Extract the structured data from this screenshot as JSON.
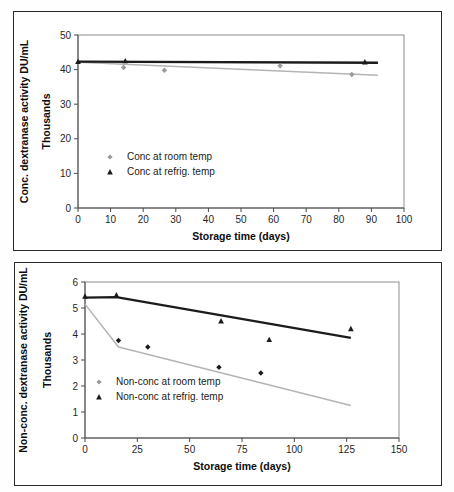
{
  "page": {
    "background": "#ffffff",
    "frame_color": "#2a2a2a"
  },
  "colors": {
    "dark_series": "#1b1b1b",
    "light_series": "#b4b4b4",
    "marker_dark": "#1b1b1b",
    "marker_light": "#9a9a9a",
    "axis": "#4a4a4a",
    "plot_frame": "#8d8d8d"
  },
  "figures": [
    {
      "id": "conc",
      "name": "concentrated-dextranase-chart",
      "ylabel_line1": "Conc. dextranase activity DU/mL",
      "ylabel_line2": "Thousands",
      "xlabel": "Storage time (days)",
      "yticks": [
        "0",
        "10",
        "20",
        "30",
        "40",
        "50"
      ],
      "xticks": [
        "0",
        "10",
        "20",
        "30",
        "40",
        "50",
        "60",
        "70",
        "80",
        "90",
        "100"
      ],
      "legend": [
        {
          "marker": "diamond",
          "label": "Conc at room temp"
        },
        {
          "marker": "triangle",
          "label": "Conc at refrig. temp"
        }
      ]
    },
    {
      "id": "nonconc",
      "name": "non-concentrated-dextranase-chart",
      "ylabel_line1": "Non-conc. dextranase activity DU/mL",
      "ylabel_line2": "Thousands",
      "xlabel": "Storage time (days)",
      "yticks": [
        "0",
        "1",
        "2",
        "3",
        "4",
        "5",
        "6"
      ],
      "xticks": [
        "0",
        "25",
        "50",
        "75",
        "100",
        "125",
        "150"
      ],
      "legend": [
        {
          "marker": "diamond",
          "label": "Non-conc at room temp"
        },
        {
          "marker": "triangle",
          "label": "Non-conc at refrig. temp"
        }
      ]
    }
  ],
  "chart_data": [
    {
      "type": "scatter",
      "id": "conc",
      "title": "",
      "xlabel": "Storage time (days)",
      "ylabel": "Conc. dextranase activity DU/mL (Thousands)",
      "xlim": [
        0,
        100
      ],
      "ylim": [
        0,
        50
      ],
      "xticks": [
        0,
        10,
        20,
        30,
        40,
        50,
        60,
        70,
        80,
        90,
        100
      ],
      "yticks": [
        0,
        10,
        20,
        30,
        40,
        50
      ],
      "grid": false,
      "legend_position": "inside-lower-left",
      "series": [
        {
          "name": "Conc at room temp",
          "marker": "diamond",
          "color": "#9a9a9a",
          "points": [
            {
              "x": 14.0,
              "y": 40.6
            },
            {
              "x": 26.5,
              "y": 39.8
            },
            {
              "x": 62.0,
              "y": 41.1
            },
            {
              "x": 84.0,
              "y": 38.6
            }
          ],
          "trendline": {
            "color": "#b4b4b4",
            "points": [
              {
                "x": 0,
                "y": 42.1
              },
              {
                "x": 92,
                "y": 38.4
              }
            ]
          }
        },
        {
          "name": "Conc at refrig. temp",
          "marker": "triangle",
          "color": "#1b1b1b",
          "points": [
            {
              "x": 0.0,
              "y": 42.3
            },
            {
              "x": 14.5,
              "y": 42.5
            },
            {
              "x": 88.0,
              "y": 42.2
            }
          ],
          "trendline": {
            "color": "#1b1b1b",
            "points": [
              {
                "x": 0,
                "y": 42.3
              },
              {
                "x": 92,
                "y": 42.0
              }
            ]
          }
        }
      ]
    },
    {
      "type": "scatter",
      "id": "nonconc",
      "title": "",
      "xlabel": "Storage time (days)",
      "ylabel": "Non-conc. dextranase activity DU/mL (Thousands)",
      "xlim": [
        0,
        150
      ],
      "ylim": [
        0,
        6
      ],
      "xticks": [
        0,
        25,
        50,
        75,
        100,
        125,
        150
      ],
      "yticks": [
        0,
        1,
        2,
        3,
        4,
        5,
        6
      ],
      "grid": false,
      "legend_position": "inside-lower-left",
      "series": [
        {
          "name": "Non-conc at room temp",
          "marker": "diamond",
          "color": "#1b1b1b",
          "points": [
            {
              "x": 16.0,
              "y": 3.75
            },
            {
              "x": 30.0,
              "y": 3.5
            },
            {
              "x": 64.0,
              "y": 2.72
            },
            {
              "x": 84.0,
              "y": 2.5
            }
          ],
          "trendline": {
            "color": "#b4b4b4",
            "points": [
              {
                "x": 0,
                "y": 5.15
              },
              {
                "x": 16,
                "y": 3.5
              },
              {
                "x": 127,
                "y": 1.25
              }
            ]
          }
        },
        {
          "name": "Non-conc at refrig. temp",
          "marker": "triangle",
          "color": "#1b1b1b",
          "points": [
            {
              "x": 0.0,
              "y": 5.45
            },
            {
              "x": 15.0,
              "y": 5.5
            },
            {
              "x": 65.0,
              "y": 4.5
            },
            {
              "x": 88.0,
              "y": 3.78
            },
            {
              "x": 127.0,
              "y": 4.2
            }
          ],
          "trendline": {
            "color": "#1b1b1b",
            "points": [
              {
                "x": 0,
                "y": 5.4
              },
              {
                "x": 15,
                "y": 5.42
              },
              {
                "x": 127,
                "y": 3.85
              }
            ]
          }
        }
      ]
    }
  ]
}
